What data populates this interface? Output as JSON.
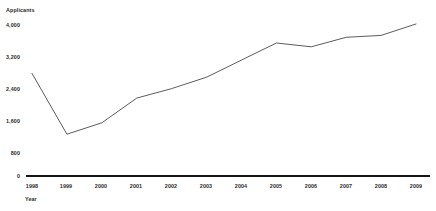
{
  "chart_data": {
    "type": "line",
    "title": "",
    "ylabel": "Applicants",
    "xlabel": "Year",
    "categories": [
      "1998",
      "1999",
      "2000",
      "2001",
      "2002",
      "2003",
      "2004",
      "2005",
      "2006",
      "2007",
      "2008",
      "2009"
    ],
    "values": [
      2700,
      1100,
      1400,
      2050,
      2300,
      2600,
      3050,
      3500,
      3400,
      3650,
      3700,
      4000
    ],
    "series": [
      {
        "name": "Applicants",
        "values": [
          2700,
          1100,
          1400,
          2050,
          2300,
          2600,
          3050,
          3500,
          3400,
          3650,
          3700,
          4000
        ]
      }
    ],
    "y_ticks": [
      0,
      800,
      1600,
      2400,
      3200,
      4000
    ],
    "y_tick_labels": [
      "0",
      "800",
      "1,600",
      "2,400",
      "3,200",
      "4,000"
    ],
    "ylim": [
      0,
      4000
    ],
    "grid": false,
    "legend": false,
    "legend_position": "none",
    "line_color": "#4a4a4a",
    "axis_color": "#151515",
    "text_color": "#2b2b2b"
  }
}
